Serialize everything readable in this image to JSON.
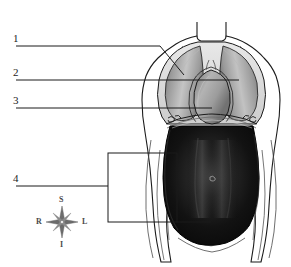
{
  "figure": {
    "background_color": "#ffffff",
    "line_color": "#1b1b1b",
    "callouts": [
      {
        "number": "1",
        "target": "right-pleural-cavity",
        "label_x": 15,
        "label_y": 33
      },
      {
        "number": "2",
        "target": "left-pleural-cavity",
        "label_x": 15,
        "label_y": 67
      },
      {
        "number": "3",
        "target": "pericardial-cavity",
        "label_x": 15,
        "label_y": 95
      },
      {
        "number": "4",
        "target": "abdominopelvic-cavity",
        "label_x": 15,
        "label_y": 173
      }
    ]
  },
  "compass": {
    "name": "anatomical-orientation-rose",
    "superior": "S",
    "inferior": "I",
    "right": "R",
    "left": "L",
    "color": "#6b6b6b"
  },
  "colors": {
    "lung_light": "#cfcfcf",
    "lung_mid": "#9a9a9a",
    "lung_dark": "#6f6f6f",
    "heart_light": "#b8b8b8",
    "heart_dark": "#7d7d7d",
    "abdomen_dark": "#0a0a0a",
    "abdomen_highlight": "#4a4a4a",
    "outline": "#1b1b1b",
    "skin": "#ffffff"
  }
}
